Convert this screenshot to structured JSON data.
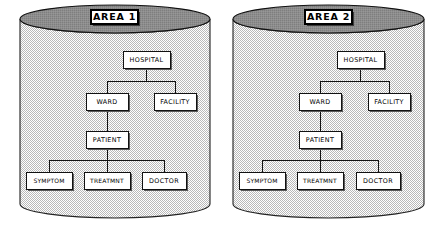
{
  "diagram": {
    "canvas": {
      "width": 437,
      "height": 226
    },
    "colors": {
      "background": "#ffffff",
      "cylinder_body_fill": "#e8e8e8",
      "cylinder_top_fill": "#8a8a8a",
      "node_fill": "#ffffff",
      "node_stroke": "#111111",
      "node_shadow": "#5a5a5a",
      "edge_stroke": "#111111",
      "label_text": "#000000"
    },
    "cylinders": [
      {
        "id": "area-1",
        "label": "AREA 1",
        "geometry": {
          "left": 20,
          "right": 210,
          "top": 5,
          "bottom": 218,
          "ellipse_rx": 95,
          "ellipse_ry": 14,
          "label_rect": {
            "x": 91,
            "y": 10,
            "w": 47,
            "h": 14
          }
        },
        "nodes": [
          {
            "id": "hospital",
            "label": "HOSPITAL",
            "x": 123,
            "y": 51,
            "w": 47,
            "h": 17,
            "wide": false
          },
          {
            "id": "ward",
            "label": "WARD",
            "x": 86,
            "y": 93,
            "w": 42,
            "h": 17,
            "wide": false
          },
          {
            "id": "facility",
            "label": "FACILITY",
            "x": 154,
            "y": 93,
            "w": 42,
            "h": 17,
            "wide": false
          },
          {
            "id": "patient",
            "label": "PATIENT",
            "x": 86,
            "y": 131,
            "w": 42,
            "h": 17,
            "wide": false
          },
          {
            "id": "symptom",
            "label": "SYMPTOM",
            "x": 26,
            "y": 172,
            "w": 46,
            "h": 17,
            "wide": true
          },
          {
            "id": "treatmnt",
            "label": "TREATMNT",
            "x": 84,
            "y": 172,
            "w": 46,
            "h": 17,
            "wide": true
          },
          {
            "id": "doctor",
            "label": "DOCTOR",
            "x": 142,
            "y": 172,
            "w": 44,
            "h": 17,
            "wide": false
          }
        ],
        "edges": [
          {
            "from": "hospital",
            "to": "ward"
          },
          {
            "from": "hospital",
            "to": "facility"
          },
          {
            "from": "ward",
            "to": "patient"
          },
          {
            "from": "patient",
            "to": "symptom"
          },
          {
            "from": "patient",
            "to": "treatmnt"
          },
          {
            "from": "patient",
            "to": "doctor"
          }
        ]
      },
      {
        "id": "area-2",
        "label": "AREA 2",
        "geometry": {
          "left": 233,
          "right": 424,
          "top": 5,
          "bottom": 218,
          "ellipse_rx": 95.5,
          "ellipse_ry": 14,
          "label_rect": {
            "x": 305,
            "y": 10,
            "w": 47,
            "h": 14
          }
        },
        "nodes": [
          {
            "id": "hospital",
            "label": "HOSPITAL",
            "x": 337,
            "y": 51,
            "w": 47,
            "h": 17,
            "wide": false
          },
          {
            "id": "ward",
            "label": "WARD",
            "x": 299,
            "y": 93,
            "w": 42,
            "h": 17,
            "wide": false
          },
          {
            "id": "facility",
            "label": "FACILITY",
            "x": 368,
            "y": 93,
            "w": 42,
            "h": 17,
            "wide": false
          },
          {
            "id": "patient",
            "label": "PATIENT",
            "x": 299,
            "y": 131,
            "w": 42,
            "h": 17,
            "wide": false
          },
          {
            "id": "symptom",
            "label": "SYMPTOM",
            "x": 239,
            "y": 172,
            "w": 46,
            "h": 17,
            "wide": true
          },
          {
            "id": "treatmnt",
            "label": "TREATMNT",
            "x": 297,
            "y": 172,
            "w": 46,
            "h": 17,
            "wide": true
          },
          {
            "id": "doctor",
            "label": "DOCTOR",
            "x": 356,
            "y": 172,
            "w": 44,
            "h": 17,
            "wide": false
          }
        ],
        "edges": [
          {
            "from": "hospital",
            "to": "ward"
          },
          {
            "from": "hospital",
            "to": "facility"
          },
          {
            "from": "ward",
            "to": "patient"
          },
          {
            "from": "patient",
            "to": "symptom"
          },
          {
            "from": "patient",
            "to": "treatmnt"
          },
          {
            "from": "patient",
            "to": "doctor"
          }
        ]
      }
    ]
  }
}
